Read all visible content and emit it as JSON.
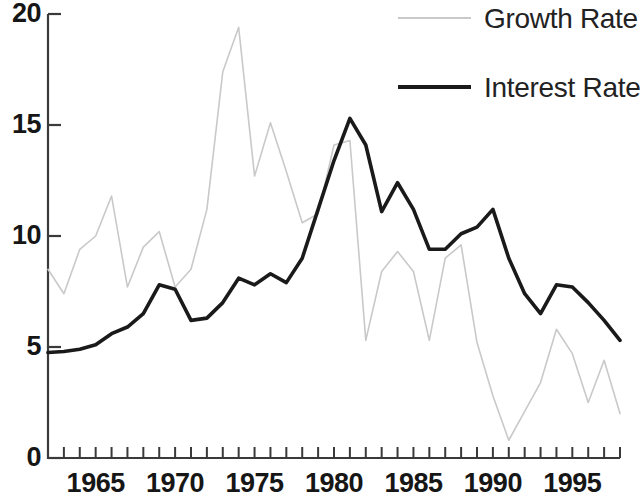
{
  "chart_data": {
    "type": "line",
    "title": "",
    "subtitle": "",
    "xlabel": "",
    "ylabel": "",
    "xlim": [
      1962,
      1998
    ],
    "ylim": [
      0,
      20
    ],
    "grid": false,
    "legend_position": "top-right",
    "y_ticks": [
      0,
      5,
      10,
      15,
      20
    ],
    "y_tick_labels": [
      "0",
      "5",
      "10",
      "15",
      "20"
    ],
    "x_ticks": [
      1962,
      1963,
      1964,
      1965,
      1966,
      1967,
      1968,
      1969,
      1970,
      1971,
      1972,
      1973,
      1974,
      1975,
      1976,
      1977,
      1978,
      1979,
      1980,
      1981,
      1982,
      1983,
      1984,
      1985,
      1986,
      1987,
      1988,
      1989,
      1990,
      1991,
      1992,
      1993,
      1994,
      1995,
      1996,
      1997,
      1998
    ],
    "x_tick_labels": [
      "1965",
      "1970",
      "1975",
      "1980",
      "1985",
      "1990",
      "1995"
    ],
    "x_tick_label_years": [
      1965,
      1970,
      1975,
      1980,
      1985,
      1990,
      1995
    ],
    "x": [
      1962,
      1963,
      1964,
      1965,
      1966,
      1967,
      1968,
      1969,
      1970,
      1971,
      1972,
      1973,
      1974,
      1975,
      1976,
      1977,
      1978,
      1979,
      1980,
      1981,
      1982,
      1983,
      1984,
      1985,
      1986,
      1987,
      1988,
      1989,
      1990,
      1991,
      1992,
      1993,
      1994,
      1995,
      1996,
      1997,
      1998
    ],
    "series": [
      {
        "name": "Growth Rate",
        "color": "#c9c9c9",
        "line_width": 1.6,
        "values": [
          8.5,
          7.4,
          9.4,
          10.0,
          11.8,
          7.7,
          9.5,
          10.2,
          7.7,
          8.5,
          11.2,
          17.4,
          19.4,
          12.7,
          15.1,
          12.9,
          10.6,
          11.0,
          14.1,
          14.3,
          5.3,
          8.4,
          9.3,
          8.4,
          5.3,
          9.0,
          9.6,
          5.2,
          2.8,
          0.8,
          2.1,
          3.4,
          5.8,
          4.7,
          2.5,
          4.4,
          2.0
        ]
      },
      {
        "name": "Interest Rate",
        "color": "#1a1a1a",
        "line_width": 3.6,
        "values": [
          4.75,
          4.8,
          4.9,
          5.1,
          5.6,
          5.9,
          6.5,
          7.8,
          7.6,
          6.2,
          6.3,
          7.0,
          8.1,
          7.8,
          8.3,
          7.9,
          9.0,
          11.2,
          13.4,
          15.3,
          14.1,
          11.1,
          12.4,
          11.2,
          9.4,
          9.4,
          10.1,
          10.4,
          11.2,
          9.0,
          7.4,
          6.5,
          7.8,
          7.7,
          7.0,
          6.2,
          5.3
        ]
      }
    ]
  },
  "legend": {
    "items": [
      {
        "label": "Growth Rate",
        "color": "#c9c9c9",
        "style": "thin"
      },
      {
        "label": "Interest Rate",
        "color": "#1a1a1a",
        "style": "thick"
      }
    ]
  },
  "axes": {
    "axis_color": "#3a3a3a",
    "tick_color": "#3a3a3a"
  }
}
